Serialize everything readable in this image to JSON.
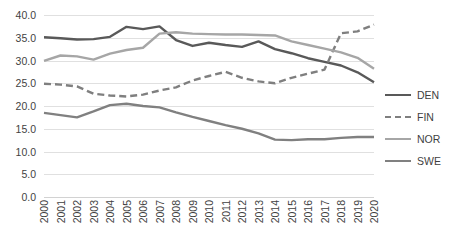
{
  "chart_data": {
    "type": "line",
    "title": "",
    "xlabel": "",
    "ylabel": "",
    "ylim": [
      0.0,
      40.0
    ],
    "ytick_step": 5.0,
    "ytick_labels": [
      "0.0",
      "5.0",
      "10.0",
      "15.0",
      "20.0",
      "25.0",
      "30.0",
      "35.0",
      "40.0"
    ],
    "grid": true,
    "legend_position": "right",
    "categories": [
      "2000",
      "2001",
      "2002",
      "2003",
      "2004",
      "2005",
      "2006",
      "2007",
      "2008",
      "2009",
      "2010",
      "2011",
      "2012",
      "2013",
      "2014",
      "2015",
      "2016",
      "2017",
      "2018",
      "2019",
      "2020"
    ],
    "series": [
      {
        "name": "DEN",
        "color": "#595959",
        "style": "solid",
        "values": [
          35.1,
          34.9,
          34.6,
          34.7,
          35.2,
          37.4,
          36.9,
          37.5,
          34.5,
          33.2,
          33.9,
          33.4,
          33.0,
          34.2,
          32.5,
          31.6,
          30.5,
          29.7,
          28.9,
          27.4,
          25.2
        ]
      },
      {
        "name": "FIN",
        "color": "#7f7f7f",
        "style": "dashed",
        "values": [
          24.9,
          24.7,
          24.3,
          22.7,
          22.3,
          22.1,
          22.5,
          23.4,
          24.1,
          25.6,
          26.6,
          27.5,
          26.2,
          25.4,
          25.0,
          26.2,
          27.1,
          28.0,
          36.0,
          36.4,
          37.9
        ]
      },
      {
        "name": "NOR",
        "color": "#a6a6a6",
        "style": "solid",
        "values": [
          29.9,
          31.1,
          30.9,
          30.2,
          31.5,
          32.3,
          32.8,
          35.9,
          36.2,
          35.9,
          35.8,
          35.7,
          35.7,
          35.6,
          35.5,
          34.2,
          33.4,
          32.6,
          31.8,
          30.6,
          28.2
        ]
      },
      {
        "name": "SWE",
        "color": "#808080",
        "style": "solid",
        "values": [
          18.5,
          18.0,
          17.5,
          18.8,
          20.2,
          20.5,
          20.0,
          19.7,
          18.6,
          17.6,
          16.7,
          15.8,
          15.0,
          14.0,
          12.6,
          12.5,
          12.7,
          12.7,
          13.0,
          13.2,
          13.2
        ]
      }
    ]
  },
  "legend": {
    "items": [
      {
        "label": "DEN"
      },
      {
        "label": "FIN"
      },
      {
        "label": "NOR"
      },
      {
        "label": "SWE"
      }
    ]
  }
}
